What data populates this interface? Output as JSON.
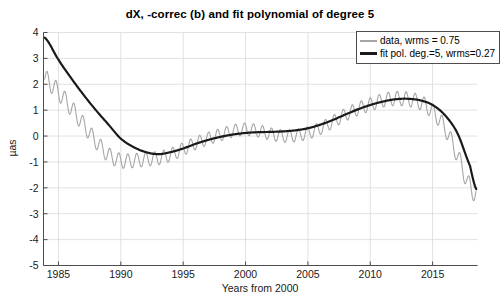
{
  "chart_data": {
    "type": "line",
    "title": "dX, -correc (b) and fit polynomial of degree 5",
    "xlabel": "Years from 2000",
    "ylabel": "µas",
    "xlim": [
      1983.8,
      2018.6
    ],
    "ylim": [
      -5,
      4
    ],
    "xticks": [
      1985,
      1990,
      1995,
      2000,
      2005,
      2010,
      2015
    ],
    "xticklabels": [
      "1985",
      "1990",
      "1995",
      "2000",
      "2005",
      "2010",
      "2015"
    ],
    "yticks": [
      -5,
      -4,
      -3,
      -2,
      -1,
      0,
      1,
      2,
      3,
      4
    ],
    "yticklabels": [
      "-5",
      "-4",
      "-3",
      "-2",
      "-1",
      "0",
      "1",
      "2",
      "3",
      "4"
    ],
    "grid": true,
    "legend_position": "upper right",
    "legend": [
      {
        "label": "data, wrms = 0.75",
        "color": "#a6a6a6",
        "style": "thin-line"
      },
      {
        "label": "fit pol. deg.=5, wrms=0.27",
        "color": "#1a1a1a",
        "style": "thick-line"
      }
    ],
    "series": [
      {
        "name": "data, wrms = 0.75",
        "color": "#a6a6a6",
        "linewidth": 1.1,
        "description": "Observed dX series with annual-scale oscillation riding on a smooth trend",
        "trend_x": [
          1983.9,
          1985.0,
          1986.0,
          1987.0,
          1988.0,
          1989.0,
          1990.0,
          1991.0,
          1992.0,
          1993.0,
          1994.0,
          1995.0,
          1996.0,
          1997.0,
          1998.0,
          1999.0,
          2000.0,
          2001.0,
          2002.0,
          2003.0,
          2004.0,
          2005.0,
          2006.0,
          2007.0,
          2008.0,
          2009.0,
          2010.0,
          2011.0,
          2012.0,
          2013.0,
          2014.0,
          2015.0,
          2016.0,
          2017.0,
          2018.0,
          2018.5
        ],
        "trend_y": [
          2.2,
          1.7,
          1.1,
          0.45,
          -0.2,
          -0.72,
          -0.95,
          -0.95,
          -0.9,
          -0.85,
          -0.72,
          -0.5,
          -0.28,
          -0.1,
          0.05,
          0.2,
          0.26,
          0.2,
          0.08,
          0.0,
          0.02,
          0.12,
          0.3,
          0.55,
          0.82,
          1.05,
          1.22,
          1.38,
          1.45,
          1.42,
          1.3,
          0.95,
          0.3,
          -0.75,
          -1.95,
          -2.2
        ],
        "oscillation_amplitude": 0.24,
        "oscillation_period_years": 0.72
      },
      {
        "name": "fit pol. deg.=5, wrms=0.27",
        "color": "#1a1a1a",
        "linewidth": 2.2,
        "description": "Degree-5 polynomial fit",
        "x": [
          1983.9,
          1985.0,
          1986.0,
          1987.0,
          1988.0,
          1989.0,
          1990.0,
          1991.0,
          1992.0,
          1993.0,
          1994.0,
          1995.0,
          1996.0,
          1997.0,
          1998.0,
          1999.0,
          2000.0,
          2001.0,
          2002.0,
          2003.0,
          2004.0,
          2005.0,
          2006.0,
          2007.0,
          2008.0,
          2009.0,
          2010.0,
          2011.0,
          2012.0,
          2013.0,
          2014.0,
          2015.0,
          2016.0,
          2017.0,
          2018.0,
          2018.5
        ],
        "y": [
          3.8,
          2.95,
          2.25,
          1.6,
          1.0,
          0.45,
          -0.1,
          -0.42,
          -0.62,
          -0.7,
          -0.62,
          -0.48,
          -0.3,
          -0.15,
          -0.03,
          0.06,
          0.12,
          0.15,
          0.16,
          0.18,
          0.22,
          0.3,
          0.44,
          0.62,
          0.83,
          1.03,
          1.2,
          1.33,
          1.42,
          1.44,
          1.38,
          1.2,
          0.8,
          0.1,
          -1.15,
          -2.05
        ]
      }
    ]
  }
}
